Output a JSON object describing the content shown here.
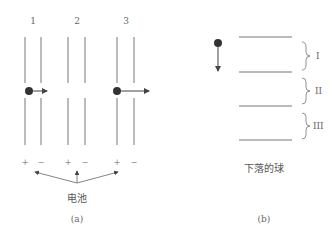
{
  "panel_a": {
    "column_labels": [
      "1",
      "2",
      "3"
    ],
    "signs": [
      "+",
      "−",
      "+",
      "−",
      "+",
      "−"
    ],
    "battery_label": "电池",
    "caption": "(a)"
  },
  "panel_b": {
    "region_labels": [
      "I",
      "II",
      "III"
    ],
    "ball_label": "下落的球",
    "caption": "(b)"
  },
  "colors": {
    "line": "#777777",
    "ball": "#333333"
  }
}
